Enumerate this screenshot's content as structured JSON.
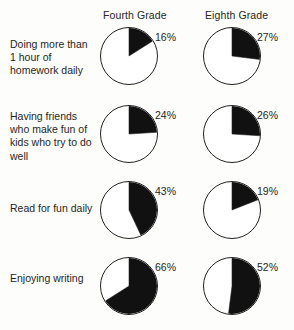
{
  "header": {
    "columns": [
      {
        "label": "Fourth Grade"
      },
      {
        "label": "Eighth Grade"
      }
    ]
  },
  "rows": [
    {
      "label": "Doing more than 1 hour of homework daily"
    },
    {
      "label": "Having friends who make fun of kids who try to do well"
    },
    {
      "label": "Read for fun daily"
    },
    {
      "label": "Enjoying writing"
    }
  ],
  "values": {
    "r0c0": "16%",
    "r0c1": "27%",
    "r1c0": "24%",
    "r1c1": "26%",
    "r2c0": "43%",
    "r2c1": "19%",
    "r3c0": "66%",
    "r3c1": "52%"
  },
  "colors": {
    "slice_fill": "#111111",
    "slice_empty": "#ffffff",
    "outline": "#222222",
    "text": "#262626",
    "background": "#fdfdfb"
  },
  "chart_data": {
    "type": "pie",
    "title": "",
    "xlabel": "",
    "ylabel": "",
    "legend_position": "none",
    "grid": false,
    "series": [
      {
        "name": "Fourth Grade",
        "values": [
          16,
          24,
          43,
          66
        ]
      },
      {
        "name": "Eighth Grade",
        "values": [
          27,
          26,
          19,
          52
        ]
      }
    ],
    "categories": [
      "Doing more than 1 hour of homework daily",
      "Having friends who make fun of kids who try to do well",
      "Read for fun daily",
      "Enjoying writing"
    ],
    "units": "percent",
    "slice_start_angle_deg": 0,
    "slice_direction": "clockwise",
    "panels": [
      {
        "row": 0,
        "column": "Fourth Grade",
        "category": "Doing more than 1 hour of homework daily",
        "value": 16,
        "label": "16%"
      },
      {
        "row": 0,
        "column": "Eighth Grade",
        "category": "Doing more than 1 hour of homework daily",
        "value": 27,
        "label": "27%"
      },
      {
        "row": 1,
        "column": "Fourth Grade",
        "category": "Having friends who make fun of kids who try to do well",
        "value": 24,
        "label": "24%"
      },
      {
        "row": 1,
        "column": "Eighth Grade",
        "category": "Having friends who make fun of kids who try to do well",
        "value": 26,
        "label": "26%"
      },
      {
        "row": 2,
        "column": "Fourth Grade",
        "category": "Read for fun daily",
        "value": 43,
        "label": "43%"
      },
      {
        "row": 2,
        "column": "Eighth Grade",
        "category": "Read for fun daily",
        "value": 19,
        "label": "19%"
      },
      {
        "row": 3,
        "column": "Fourth Grade",
        "category": "Enjoying writing",
        "value": 66,
        "label": "66%"
      },
      {
        "row": 3,
        "column": "Eighth Grade",
        "category": "Enjoying writing",
        "value": 52,
        "label": "52%"
      }
    ]
  }
}
